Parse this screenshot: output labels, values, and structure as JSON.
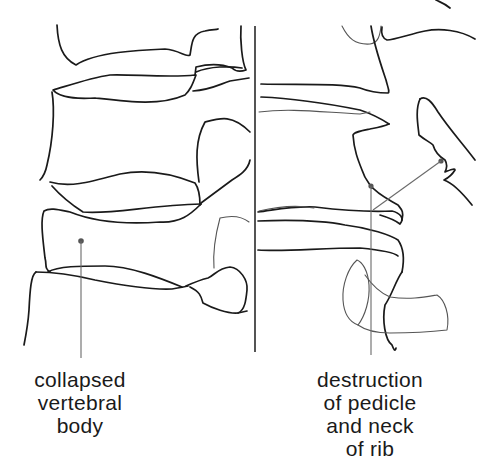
{
  "diagram": {
    "panels": [
      {
        "id": "left",
        "view": "collapsed vertebral body"
      },
      {
        "id": "right",
        "view": "destroyed pedicle and rib neck"
      }
    ],
    "labels": [
      {
        "id": "collapsed-vertebral-body",
        "lines": [
          "collapsed",
          "vertebral",
          "body"
        ]
      },
      {
        "id": "destruction-pedicle-rib",
        "lines": [
          "destruction",
          "of pedicle",
          "and neck",
          "of rib"
        ]
      }
    ],
    "colors": {
      "line": "#1a1a1a",
      "leader": "#6a6a6a",
      "background": "#ffffff"
    }
  }
}
